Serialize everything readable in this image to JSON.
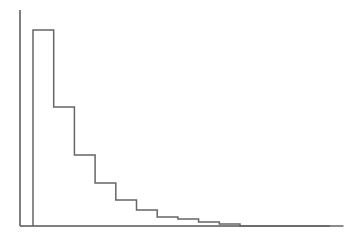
{
  "chart_data": {
    "type": "bar",
    "subtype": "step-histogram",
    "title": "",
    "xlabel": "",
    "ylabel": "",
    "grid": false,
    "legend": null,
    "tick_labels_shown": false,
    "bins": 15,
    "values": [
      196,
      119,
      71,
      43,
      26,
      16,
      9,
      7,
      4,
      2,
      0,
      0,
      0,
      0,
      0
    ],
    "ylim": [
      0,
      216
    ],
    "colors": {
      "line": "#666666",
      "axis": "#555555",
      "background": "#ffffff"
    }
  },
  "layout": {
    "axis_origin": [
      20,
      226
    ],
    "y_axis_top": 10,
    "x_axis_right": 330,
    "first_bin_left": 33,
    "bin_width": 20.7
  }
}
